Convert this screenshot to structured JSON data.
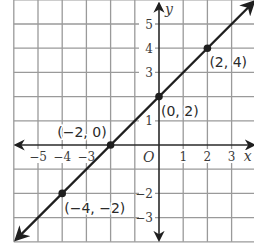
{
  "chart_data": {
    "type": "line",
    "title": "",
    "xlabel": "x",
    "ylabel": "y",
    "origin_label": "O",
    "xlim": [
      -6,
      4
    ],
    "ylim": [
      -4,
      6
    ],
    "grid": true,
    "x_ticks": [
      {
        "value": -5,
        "label": "−5"
      },
      {
        "value": -4,
        "label": "−4"
      },
      {
        "value": -3,
        "label": "−3"
      },
      {
        "value": 1,
        "label": "1"
      },
      {
        "value": 2,
        "label": "2"
      },
      {
        "value": 3,
        "label": "3"
      }
    ],
    "y_ticks": [
      {
        "value": 5,
        "label": "5"
      },
      {
        "value": 4,
        "label": "4"
      },
      {
        "value": 3,
        "label": "3"
      },
      {
        "value": 1,
        "label": "1"
      },
      {
        "value": -2,
        "label": "−2"
      },
      {
        "value": -3,
        "label": "−3"
      }
    ],
    "series": [
      {
        "name": "y = x + 2",
        "line_extends": [
          [
            -5.9,
            -3.9
          ],
          [
            3.9,
            5.9
          ]
        ],
        "points": [
          {
            "x": -4,
            "y": -2,
            "label": "(−4, −2)"
          },
          {
            "x": -2,
            "y": 0,
            "label": "(−2, 0)"
          },
          {
            "x": 0,
            "y": 2,
            "label": "(0, 2)"
          },
          {
            "x": 2,
            "y": 4,
            "label": "(2, 4)"
          }
        ]
      }
    ]
  },
  "colors": {
    "grid": "#9a9a9a",
    "axis": "#2a2a2a",
    "line": "#1f1f1f",
    "text": "#3a3a3a"
  }
}
